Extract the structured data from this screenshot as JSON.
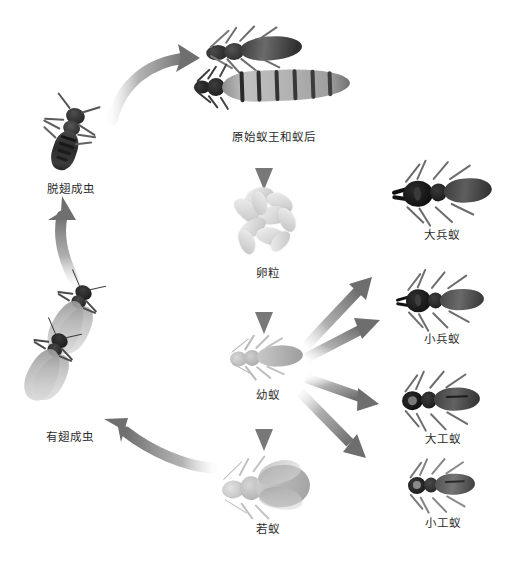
{
  "diagram": {
    "type": "life-cycle",
    "background_color": "#ffffff",
    "arrow_color": "#8a8a8a",
    "label_color": "#2b2b2b"
  },
  "nodes": [
    {
      "id": "primary-king-queen",
      "label": "原始蚁王和蚁后",
      "position": "top-center",
      "x": 272,
      "y": 36,
      "count": 2,
      "icon": "termite-king-queen-pair"
    },
    {
      "id": "eggs",
      "label": "卵粒",
      "position": "center-upper",
      "x": 272,
      "y": 190,
      "icon": "termite-egg-cluster"
    },
    {
      "id": "larva",
      "label": "幼蚁",
      "position": "center",
      "x": 272,
      "y": 330,
      "icon": "termite-larva"
    },
    {
      "id": "nymph",
      "label": "若蚁",
      "position": "center-lower",
      "x": 272,
      "y": 455,
      "icon": "termite-nymph"
    },
    {
      "id": "alate-adult",
      "label": "有翅成虫",
      "position": "left-lower",
      "x": 66,
      "y": 290,
      "count": 2,
      "icon": "winged-termite-pair"
    },
    {
      "id": "dealate-adult",
      "label": "脱翅成虫",
      "position": "left-upper",
      "x": 70,
      "y": 105,
      "icon": "dealate-termite"
    },
    {
      "id": "major-soldier",
      "label": "大兵蚁",
      "position": "right-1",
      "x": 440,
      "y": 165,
      "icon": "major-soldier-termite"
    },
    {
      "id": "minor-soldier",
      "label": "小兵蚁",
      "position": "right-2",
      "x": 440,
      "y": 275,
      "icon": "minor-soldier-termite"
    },
    {
      "id": "major-worker",
      "label": "大工蚁",
      "position": "right-3",
      "x": 440,
      "y": 378,
      "icon": "major-worker-termite"
    },
    {
      "id": "minor-worker",
      "label": "小工蚁",
      "position": "right-4",
      "x": 440,
      "y": 462,
      "icon": "minor-worker-termite"
    }
  ],
  "arrows": [
    {
      "id": "arrow-dealate-to-king-queen",
      "from": "dealate-adult",
      "to": "primary-king-queen",
      "style": "curved",
      "direction": "right-up"
    },
    {
      "id": "arrow-king-queen-to-eggs",
      "from": "primary-king-queen",
      "to": "eggs",
      "style": "straight",
      "direction": "down"
    },
    {
      "id": "arrow-eggs-to-larva",
      "from": "eggs",
      "to": "larva",
      "style": "straight",
      "direction": "down"
    },
    {
      "id": "arrow-larva-to-nymph",
      "from": "larva",
      "to": "nymph",
      "style": "straight",
      "direction": "down"
    },
    {
      "id": "arrow-nymph-to-alate",
      "from": "nymph",
      "to": "alate-adult",
      "style": "curved",
      "direction": "left-up"
    },
    {
      "id": "arrow-alate-to-dealate",
      "from": "alate-adult",
      "to": "dealate-adult",
      "style": "curved",
      "direction": "up"
    },
    {
      "id": "arrow-larva-to-major-soldier",
      "from": "larva",
      "to": "major-soldier",
      "style": "straight",
      "direction": "up-right"
    },
    {
      "id": "arrow-larva-to-minor-soldier",
      "from": "larva",
      "to": "minor-soldier",
      "style": "straight",
      "direction": "up-right"
    },
    {
      "id": "arrow-larva-to-major-worker",
      "from": "larva",
      "to": "major-worker",
      "style": "straight",
      "direction": "down-right"
    },
    {
      "id": "arrow-larva-to-minor-worker",
      "from": "larva",
      "to": "minor-worker",
      "style": "straight",
      "direction": "down-right"
    }
  ]
}
